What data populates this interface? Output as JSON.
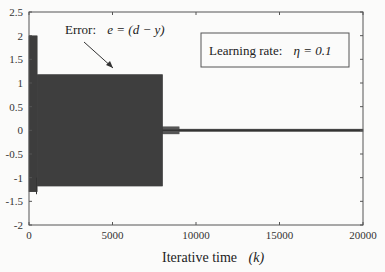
{
  "chart_data": {
    "type": "line",
    "title": "",
    "xlabel": "Iterative time",
    "xlabel_math": "(k)",
    "ylabel": "",
    "xlim": [
      0,
      20000
    ],
    "ylim": [
      -2,
      2.5
    ],
    "xticks": [
      0,
      5000,
      10000,
      15000,
      20000
    ],
    "xtick_labels": [
      "0",
      "5000",
      "10000",
      "15000",
      "20000"
    ],
    "yticks": [
      -2,
      -1.5,
      -1,
      -0.5,
      0,
      0.5,
      1,
      1.5,
      2,
      2.5
    ],
    "ytick_labels": [
      "-2",
      "-1.5",
      "-1",
      "-0.5",
      "0",
      "0.5",
      "1",
      "1.5",
      "2",
      "2.5"
    ],
    "grid": false,
    "series": [
      {
        "name": "Error e = (d - y)",
        "description": "Dense oscillating error signal",
        "segments": [
          {
            "k_start": 0,
            "k_end": 500,
            "upper": 2.0,
            "lower": -1.3
          },
          {
            "k_start": 500,
            "k_end": 8000,
            "upper": 1.18,
            "lower": -1.18
          },
          {
            "k_start": 8000,
            "k_end": 9000,
            "upper": 0.08,
            "lower": -0.08
          },
          {
            "k_start": 9000,
            "k_end": 20000,
            "upper": 0.03,
            "lower": -0.03
          }
        ],
        "color": "#2b2b2b"
      }
    ],
    "annotations": [
      {
        "text": "Error:",
        "math": "e = (d − y)",
        "arrow_to_k": 4800,
        "arrow_to_y": 1.3
      },
      {
        "text": "Learning rate:",
        "math": "η = 0.1",
        "boxed": true
      }
    ]
  }
}
